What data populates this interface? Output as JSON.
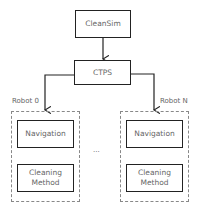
{
  "diagram": {
    "top_node": "CleanSim",
    "middle_node": "CTPS",
    "robots": [
      {
        "label": "Robot 0",
        "modules": [
          "Navigation",
          "Cleaning Method"
        ]
      },
      {
        "label": "Robot N",
        "modules": [
          "Navigation",
          "Cleaning Method"
        ]
      }
    ],
    "ellipsis": "...",
    "colors": {
      "stroke": "#222222",
      "dashed": "#888888",
      "text": "#666666"
    }
  }
}
